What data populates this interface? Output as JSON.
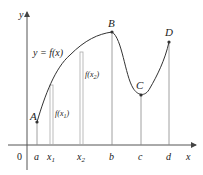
{
  "figure": {
    "y_equation": "y = f(x)",
    "axis_labels": {
      "x": "x",
      "y": "y",
      "origin": "0"
    },
    "tick_labels": [
      {
        "key": "a",
        "text": "a",
        "x": 37
      },
      {
        "key": "x1",
        "text": "x",
        "sub": "1",
        "x": 51
      },
      {
        "key": "x2",
        "text": "x",
        "sub": "2",
        "x": 81
      },
      {
        "key": "b",
        "text": "b",
        "x": 112
      },
      {
        "key": "c",
        "text": "c",
        "x": 141
      },
      {
        "key": "d",
        "text": "d",
        "x": 169
      }
    ],
    "points": [
      {
        "label": "A",
        "x": 37,
        "y": 122
      },
      {
        "label": "B",
        "x": 112,
        "y": 32
      },
      {
        "label": "C",
        "x": 141,
        "y": 95
      },
      {
        "label": "D",
        "x": 169,
        "y": 42
      }
    ],
    "bars": [
      {
        "label": "f(x1)",
        "func": "f(x",
        "sub": "1",
        "x": 51
      },
      {
        "label": "f(x2)",
        "func": "f(x",
        "sub": "2",
        "x": 81
      }
    ],
    "colors": {
      "curve": "#333333",
      "axis": "#555555",
      "lines": "#888888",
      "bars": "#aaaaaa"
    }
  }
}
